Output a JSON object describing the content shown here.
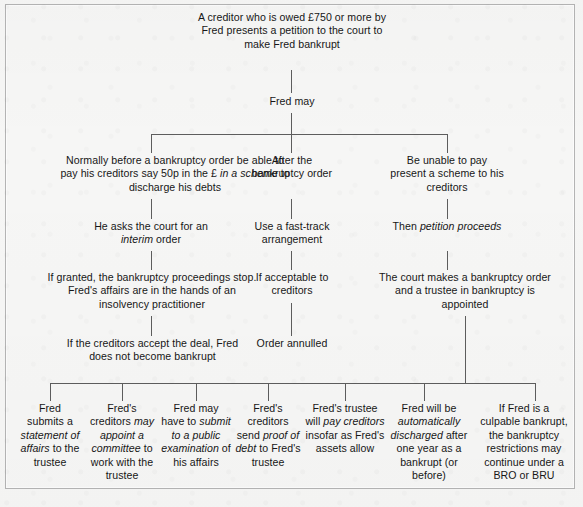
{
  "diagram": {
    "title_node": "A creditor who is owed £750 or more by Fred presents a petition to the court to make Fred bankrupt",
    "nodes": {
      "root": "A creditor who is owed £750 or more by Fred presents a petition to the court to make Fred bankrupt",
      "fred_may": "Fred may",
      "branch_left_1": "Normally before a bankruptcy order be able to pay his creditors say 50p in the £ in a scheme to discharge his debts",
      "branch_left_2": "He asks the court for an interim order",
      "branch_left_3": "If granted, the bankruptcy proceedings stop. Fred's affairs are in the hands of an insolvency practitioner",
      "branch_left_4": "If the creditors accept the deal, Fred does not become bankrupt",
      "branch_mid_1": "After the bankruptcy order",
      "branch_mid_2": "Use a fast-track arrangement",
      "branch_mid_3": "If acceptable to creditors",
      "branch_mid_4": "Order annulled",
      "branch_right_1": "Be unable to pay present a scheme to his creditors",
      "branch_right_2": "Then petition proceeds",
      "branch_right_3": "The court makes a bankruptcy order and a trustee in bankruptcy is appointed"
    },
    "outcomes": [
      "Fred submits a statement of affairs to the trustee",
      "Fred's creditors may appoint a committee to work with the trustee",
      "Fred may have to submit to a public examination of his affairs",
      "Fred's creditors send proof of debt to Fred's trustee",
      "Fred's trustee will pay creditors insofar as Fred's assets allow",
      "Fred will be automatically discharged after one year as a bankrupt (or before)",
      "If Fred is a culpable bankrupt, the bankruptcy restrictions may continue under a BRO or BRU"
    ],
    "colors": {
      "background": "#f6f6f5",
      "text": "#171717",
      "connector": "#5d5d5d",
      "frame": "#b4b4b4"
    }
  }
}
